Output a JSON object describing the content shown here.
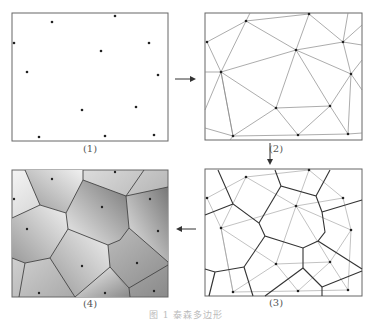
{
  "panels": [
    {
      "label": "(1)",
      "title": "point set"
    },
    {
      "label": "(2)",
      "title": "Delaunay triangulation"
    },
    {
      "label": "(3)",
      "title": "Voronoi over triangulation"
    },
    {
      "label": "(4)",
      "title": "Voronoi polygons shaded"
    }
  ],
  "caption": "图 1   泰森多边形",
  "colors": {
    "line": "#555555",
    "thin": "#888888",
    "point": "#222222"
  }
}
